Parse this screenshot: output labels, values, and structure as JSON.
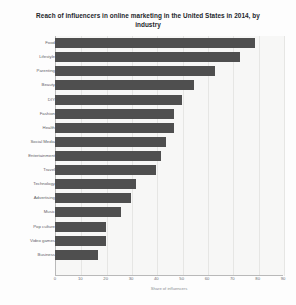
{
  "chart_data": {
    "type": "bar",
    "orientation": "horizontal",
    "title": "Reach of influencers in online marketing in the United States in 2014, by industry",
    "xlabel": "Share of influencers",
    "ylabel": "",
    "xlim": [
      0,
      90
    ],
    "grid": true,
    "legend": false,
    "bar_color": "#4f4f4f",
    "plot_background": "#f7f7f6",
    "xticks": [
      0,
      10,
      20,
      30,
      40,
      50,
      60,
      70,
      80,
      90
    ],
    "xtick_labels": [
      "0",
      "10",
      "20",
      "30",
      "40",
      "50",
      "60",
      "70",
      "80",
      "90"
    ],
    "categories": [
      "Food",
      "Lifestyle",
      "Parenting",
      "Beauty",
      "DIY",
      "Fashion",
      "Health",
      "Social Media",
      "Entertainment",
      "Travel",
      "Technology",
      "Advertising",
      "Music",
      "Pop culture",
      "Video games",
      "Business",
      ""
    ],
    "values": [
      79,
      73,
      63,
      55,
      50,
      47,
      47,
      44,
      42,
      40,
      32,
      30,
      26,
      20,
      20,
      17,
      0
    ]
  }
}
